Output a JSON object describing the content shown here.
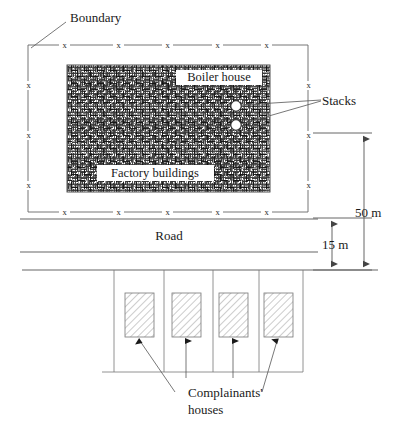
{
  "figure": {
    "kind": "site-plan-diagram"
  },
  "labels": {
    "boundary": "Boundary",
    "stacks": "Stacks",
    "boiler_house": "Boiler house",
    "factory_buildings": "Factory buildings",
    "road": "Road",
    "complainants_line1": "Complainants'",
    "complainants_line2": "houses"
  },
  "dimensions": {
    "separation_factory_to_road": "50 m",
    "road_to_houses": "15 m"
  },
  "fence": {
    "marker_glyph": "x",
    "top_marker_count": 5,
    "bottom_marker_count": 5,
    "left_marker_count": 3,
    "right_marker_count": 3
  },
  "features": {
    "stack_count": 2,
    "house_count": 4
  },
  "colors": {
    "ink": "#1a1a1a",
    "line": "#555555",
    "fence": "#666666",
    "hatch": "#999999",
    "paper": "#ffffff"
  }
}
